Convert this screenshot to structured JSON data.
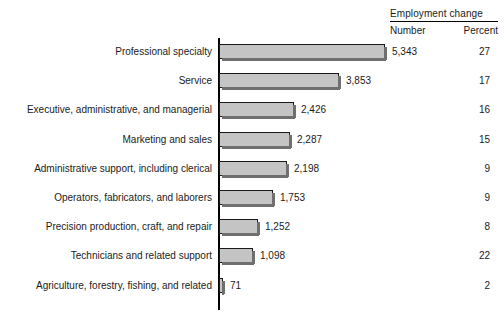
{
  "header": {
    "title": "Employment change",
    "col_number": "Number",
    "col_percent": "Percent"
  },
  "chart_data": {
    "type": "bar",
    "orientation": "horizontal",
    "title": "Employment change",
    "xlabel": "",
    "ylabel": "",
    "grid": false,
    "legend": "none",
    "xlim": [
      0,
      5343
    ],
    "categories": [
      "Professional specialty",
      "Service",
      "Executive, administrative, and managerial",
      "Marketing and sales",
      "Administrative support, including clerical",
      "Operators, fabricators, and laborers",
      "Precision production, craft, and repair",
      "Technicians and related support",
      "Agriculture, forestry, fishing, and related"
    ],
    "values": [
      5343,
      3853,
      2426,
      2287,
      2198,
      1753,
      1252,
      1098,
      71
    ],
    "value_labels": [
      "5,343",
      "3,853",
      "2,426",
      "2,287",
      "2,198",
      "1,753",
      "1,252",
      "1,098",
      "71"
    ],
    "percent_labels": [
      "27",
      "17",
      "16",
      "15",
      "9",
      "9",
      "8",
      "22",
      "2"
    ],
    "series": [
      {
        "name": "Number",
        "values": [
          5343,
          3853,
          2426,
          2287,
          2198,
          1753,
          1252,
          1098,
          71
        ]
      },
      {
        "name": "Percent",
        "values": [
          27,
          17,
          16,
          15,
          9,
          9,
          8,
          22,
          2
        ]
      }
    ],
    "colors": {
      "bar_fill": "#c4c4c4",
      "bar_stroke": "#1a1a1a",
      "shadow": "#6f6f6f",
      "text": "#1b1b1b"
    }
  },
  "rows": [
    {
      "label": "Professional specialty",
      "value": 5343,
      "number": "5,343",
      "percent": "27"
    },
    {
      "label": "Service",
      "value": 3853,
      "number": "3,853",
      "percent": "17"
    },
    {
      "label": "Executive, administrative, and managerial",
      "value": 2426,
      "number": "2,426",
      "percent": "16"
    },
    {
      "label": "Marketing and sales",
      "value": 2287,
      "number": "2,287",
      "percent": "15"
    },
    {
      "label": "Administrative support, including clerical",
      "value": 2198,
      "number": "2,198",
      "percent": "9"
    },
    {
      "label": "Operators, fabricators, and laborers",
      "value": 1753,
      "number": "1,753",
      "percent": "9"
    },
    {
      "label": "Precision production, craft, and repair",
      "value": 1252,
      "number": "1,252",
      "percent": "8"
    },
    {
      "label": "Technicians and related support",
      "value": 1098,
      "number": "1,098",
      "percent": "22"
    },
    {
      "label": "Agriculture, forestry, fishing, and related",
      "value": 71,
      "number": "71",
      "percent": "2"
    }
  ]
}
